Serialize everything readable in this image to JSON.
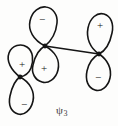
{
  "figure": {
    "type": "molecular-orbital-diagram",
    "title": "",
    "background_color": "#fdfdfc",
    "stroke_color": "#151515",
    "label": {
      "symbol": "ψ",
      "subscript": "3",
      "full": "ψ₃"
    },
    "nodes": [
      {
        "name": "center-node",
        "x": 45,
        "y": 46
      },
      {
        "name": "left-node",
        "x": 20,
        "y": 77
      },
      {
        "name": "right-node",
        "x": 99,
        "y": 54
      }
    ],
    "bonds": [
      {
        "name": "center-to-right-bond",
        "from": "center-node",
        "to": "right-node"
      }
    ],
    "lobes": [
      {
        "id": "top-center-lobe",
        "sign": "−",
        "sign_name": "minus",
        "attached_node": "center-node",
        "sign_x": 42,
        "sign_y": 19
      },
      {
        "id": "lower-center-lobe",
        "sign": "+",
        "sign_name": "plus",
        "attached_node": "center-node",
        "sign_x": 44,
        "sign_y": 68
      },
      {
        "id": "upper-left-lobe",
        "sign": "+",
        "sign_name": "plus",
        "attached_node": "left-node",
        "sign_x": 22,
        "sign_y": 64
      },
      {
        "id": "lower-left-lobe",
        "sign": "−",
        "sign_name": "minus",
        "attached_node": "left-node",
        "sign_x": 24,
        "sign_y": 104
      },
      {
        "id": "upper-right-lobe",
        "sign": "+",
        "sign_name": "plus",
        "attached_node": "right-node",
        "sign_x": 100,
        "sign_y": 25
      },
      {
        "id": "lower-right-lobe",
        "sign": "−",
        "sign_name": "minus",
        "attached_node": "right-node",
        "sign_x": 98,
        "sign_y": 77
      }
    ]
  }
}
